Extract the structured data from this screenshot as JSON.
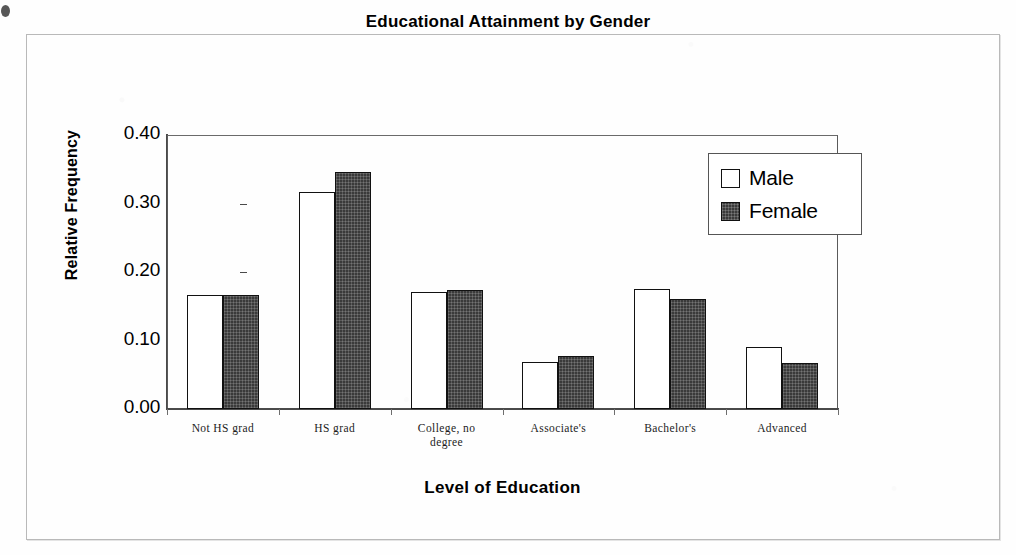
{
  "figure": {
    "title": "Educational Attainment by Gender",
    "x_axis_title": "Level of Education",
    "y_axis_title": "Relative Frequency"
  },
  "legend": {
    "items": [
      {
        "label": "Male",
        "swatch": "white-square-icon",
        "color": "#ffffff"
      },
      {
        "label": "Female",
        "swatch": "filled-square-icon",
        "color": "#3a3a3a"
      }
    ]
  },
  "axis": {
    "y_ticks": [
      "0.40",
      "0.30",
      "0.20",
      "0.10",
      "0.00"
    ]
  },
  "chart_data": {
    "type": "bar",
    "title": "Educational Attainment by Gender",
    "xlabel": "Level of Education",
    "ylabel": "Relative Frequency",
    "ylim": [
      0.0,
      0.4
    ],
    "ytick_values": [
      0.0,
      0.1,
      0.2,
      0.3,
      0.4
    ],
    "ytick_labels": [
      "0.00",
      "0.10",
      "0.20",
      "0.30",
      "0.40"
    ],
    "grid": false,
    "legend_position": "top-right",
    "categories": [
      "Not HS grad",
      "HS grad",
      "College, no degree",
      "Associate's",
      "Bachelor's",
      "Advanced"
    ],
    "category_lines": [
      [
        "Not HS grad"
      ],
      [
        "HS grad"
      ],
      [
        "College, no",
        "degree"
      ],
      [
        "Associate's"
      ],
      [
        "Bachelor's"
      ],
      [
        "Advanced"
      ]
    ],
    "series": [
      {
        "name": "Male",
        "color": "#ffffff",
        "values": [
          0.166,
          0.317,
          0.171,
          0.069,
          0.175,
          0.091
        ]
      },
      {
        "name": "Female",
        "color": "#3a3a3a",
        "values": [
          0.166,
          0.346,
          0.174,
          0.077,
          0.16,
          0.067
        ]
      }
    ]
  }
}
